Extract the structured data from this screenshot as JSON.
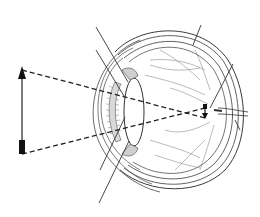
{
  "diagram": {
    "colors": {
      "background": "#ffffff",
      "line": "#2a2a2a",
      "thin_line": "#555555",
      "vessel": "#777777",
      "dashed": "#222222"
    },
    "object_arrow": {
      "x": 22,
      "top_y": 68,
      "bottom_y": 155,
      "orientation": "upright"
    },
    "image_arrow": {
      "x": 204,
      "top_y": 107,
      "bottom_y": 118,
      "orientation": "inverted"
    },
    "rays": [
      {
        "from": [
          22,
          70
        ],
        "to": [
          205,
          118
        ]
      },
      {
        "from": [
          22,
          154
        ],
        "to": [
          205,
          108
        ]
      }
    ],
    "pointer_lines": [
      {
        "name": "pointer-upper-1",
        "from": [
          96,
          27
        ],
        "to": [
          128,
          82
        ]
      },
      {
        "name": "pointer-upper-2",
        "from": [
          96,
          50
        ],
        "to": [
          124,
          96
        ]
      },
      {
        "name": "pointer-top-right",
        "from": [
          201,
          25
        ],
        "to": [
          193,
          45
        ]
      },
      {
        "name": "pointer-right",
        "from": [
          233,
          64
        ],
        "to": [
          210,
          108
        ]
      },
      {
        "name": "pointer-lower-1",
        "from": [
          100,
          170
        ],
        "to": [
          125,
          117
        ]
      },
      {
        "name": "pointer-lower-2",
        "from": [
          99,
          203
        ],
        "to": [
          129,
          141
        ]
      },
      {
        "name": "pointer-optic",
        "from": [
          240,
          130
        ],
        "to": [
          235,
          120
        ]
      }
    ],
    "labels": []
  }
}
